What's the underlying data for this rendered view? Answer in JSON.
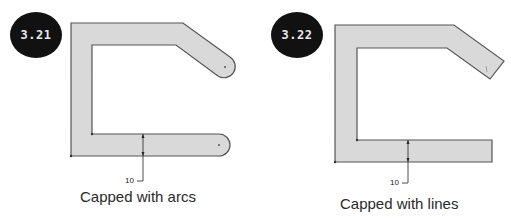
{
  "figures": [
    {
      "badge": "3.21",
      "caption": "Capped with arcs",
      "dimension_label": "10",
      "cap_style": "arc"
    },
    {
      "badge": "3.22",
      "caption": "Capped with lines",
      "dimension_label": "10",
      "cap_style": "line"
    }
  ],
  "colors": {
    "fill": "#d9d9d9",
    "outline": "#555555",
    "badge": "#111111"
  }
}
